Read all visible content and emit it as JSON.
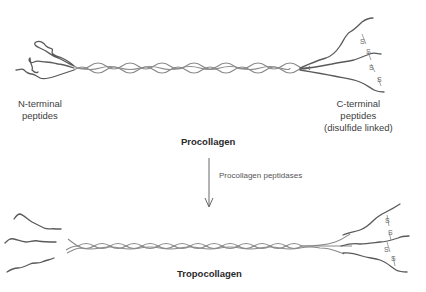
{
  "procollagen": {
    "title": "Procollagen",
    "n_terminal_label_line1": "N-terminal",
    "n_terminal_label_line2": "peptides",
    "c_terminal_label_line1": "C-terminal",
    "c_terminal_label_line2": "peptides",
    "c_terminal_label_line3": "(disulfide linked)"
  },
  "conversion": {
    "enzyme_label": "Procollagen peptidases",
    "arrow_direction": "down"
  },
  "tropocollagen": {
    "title": "Tropocollagen"
  },
  "disulfide_symbol": "S",
  "colors": {
    "strand": "#5a5a5a",
    "helix": "#8a8a8a",
    "text": "#3e3e3e",
    "background": "#ffffff"
  }
}
